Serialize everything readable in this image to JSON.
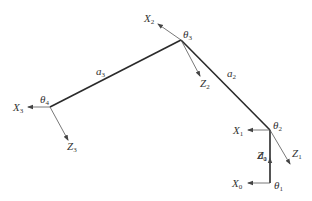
{
  "diagram": {
    "type": "robot-arm-kinematic-frames",
    "colors": {
      "link": "#2a2a2a",
      "axis": "#555555",
      "text": "#333333"
    },
    "joints": [
      {
        "id": "theta1",
        "label": "θ",
        "sub": "1",
        "x": 270,
        "y": 183
      },
      {
        "id": "theta2",
        "label": "θ",
        "sub": "2",
        "x": 270,
        "y": 130
      },
      {
        "id": "theta3",
        "label": "θ",
        "sub": "3",
        "x": 181,
        "y": 40
      },
      {
        "id": "theta4",
        "label": "θ",
        "sub": "4",
        "x": 50,
        "y": 107
      }
    ],
    "links": [
      {
        "id": "d1",
        "label": "d",
        "sub": "1"
      },
      {
        "id": "a2",
        "label": "a",
        "sub": "2"
      },
      {
        "id": "a3",
        "label": "a",
        "sub": "3"
      }
    ],
    "axes": [
      {
        "id": "X0",
        "label": "X",
        "sub": "0"
      },
      {
        "id": "Z0",
        "label": "Z",
        "sub": "0"
      },
      {
        "id": "X1",
        "label": "X",
        "sub": "1"
      },
      {
        "id": "Z1",
        "label": "Z",
        "sub": "1"
      },
      {
        "id": "X2",
        "label": "X",
        "sub": "2"
      },
      {
        "id": "Z2",
        "label": "Z",
        "sub": "2"
      },
      {
        "id": "X3",
        "label": "X",
        "sub": "3"
      },
      {
        "id": "Z3",
        "label": "Z",
        "sub": "3"
      }
    ]
  }
}
